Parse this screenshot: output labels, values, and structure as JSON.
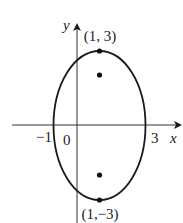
{
  "diagram": {
    "type": "ellipse-with-foci",
    "axes": {
      "x_label": "x",
      "y_label": "y"
    },
    "tick_labels": {
      "left_intercept": "−1",
      "origin": "0",
      "right_intercept": "3"
    },
    "points": {
      "top_vertex_label": "(1, 3)",
      "bottom_vertex_label": "(1,−3)"
    },
    "ellipse": {
      "center": [
        1,
        0
      ],
      "x_intercepts": [
        -1,
        3
      ],
      "vertices": [
        [
          1,
          3
        ],
        [
          1,
          -3
        ]
      ],
      "foci_marked": 2
    },
    "colors": {
      "stroke": "#1a1a1a",
      "background": "#ffffff"
    }
  }
}
